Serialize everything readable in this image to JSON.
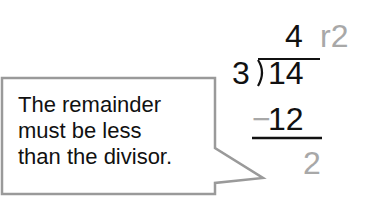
{
  "callout": {
    "lines": [
      "The remainder",
      "must be less",
      "than the divisor."
    ],
    "border_color": "#9a9a9a"
  },
  "division": {
    "quotient": "4",
    "remainder_label": "r2",
    "divisor": "3",
    "dividend": "14",
    "minus_sign": "−",
    "subtrahend": "12",
    "difference": "2",
    "colors": {
      "main": "#111111",
      "accent_gray": "#a8a8a8"
    }
  }
}
